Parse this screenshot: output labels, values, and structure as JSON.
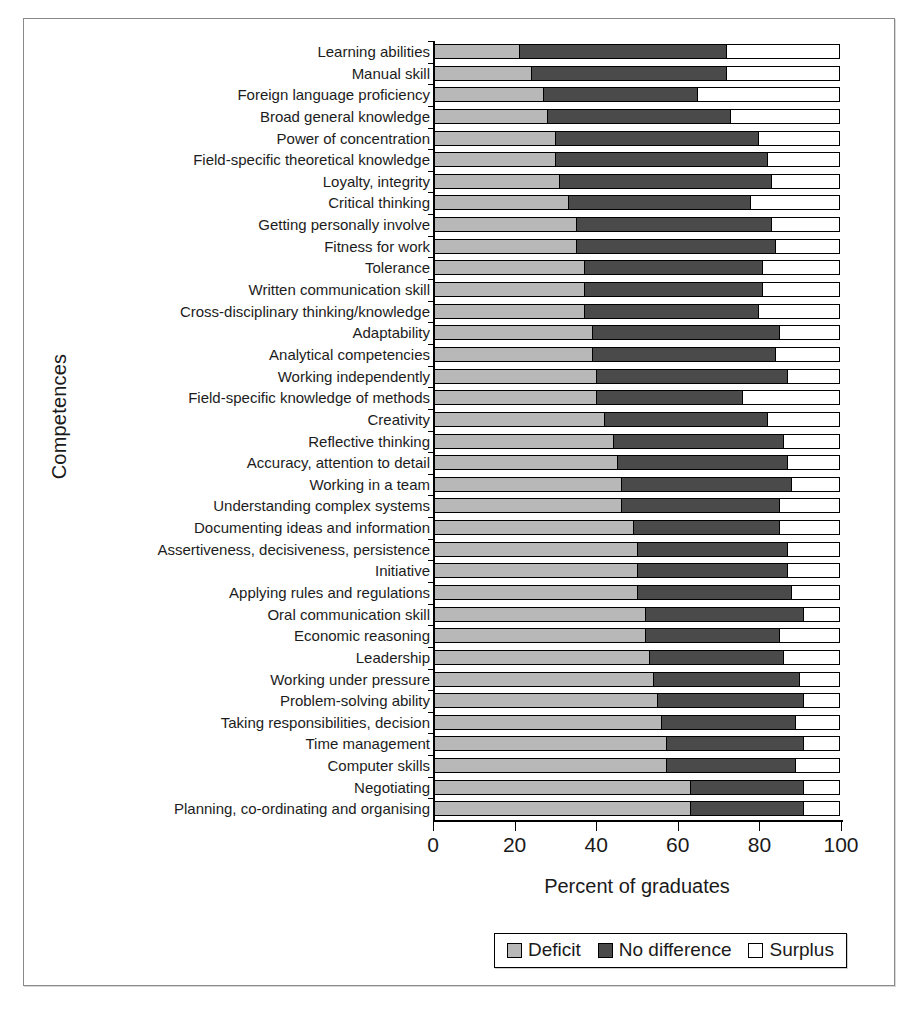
{
  "chart_data": {
    "type": "bar",
    "orientation": "horizontal",
    "stacked": true,
    "title": "",
    "xlabel": "Percent of graduates",
    "ylabel": "Competences",
    "xlim": [
      0,
      100
    ],
    "xticks": [
      "0",
      "20",
      "40",
      "60",
      "80",
      "100"
    ],
    "grid": false,
    "legend_position": "bottom",
    "legend": [
      "Deficit",
      "No difference",
      "Surplus"
    ],
    "colors": {
      "deficit": "#b8b8b8",
      "no_difference": "#4a4a4a",
      "surplus": "#ffffff",
      "outline": "#000000"
    },
    "categories": [
      "Learning abilities",
      "Manual skill",
      "Foreign language proficiency",
      "Broad general knowledge",
      "Power of concentration",
      "Field-specific theoretical knowledge",
      "Loyalty, integrity",
      "Critical thinking",
      "Getting personally involve",
      "Fitness for work",
      "Tolerance",
      "Written communication skill",
      "Cross-disciplinary thinking/knowledge",
      "Adaptability",
      "Analytical competencies",
      "Working independently",
      "Field-specific knowledge of methods",
      "Creativity",
      "Reflective thinking",
      "Accuracy, attention to detail",
      "Working in a team",
      "Understanding complex systems",
      "Documenting ideas and information",
      "Assertiveness, decisiveness, persistence",
      "Initiative",
      "Applying rules and regulations",
      "Oral communication skill",
      "Economic reasoning",
      "Leadership",
      "Working under pressure",
      "Problem-solving ability",
      "Taking responsibilities, decision",
      "Time management",
      "Computer skills",
      "Negotiating",
      "Planning, co-ordinating and organising"
    ],
    "series": [
      {
        "name": "Deficit",
        "values": [
          21,
          24,
          27,
          28,
          30,
          30,
          31,
          33,
          35,
          35,
          37,
          37,
          37,
          39,
          39,
          40,
          40,
          42,
          44,
          45,
          46,
          46,
          49,
          50,
          50,
          50,
          52,
          52,
          53,
          54,
          55,
          56,
          57,
          57,
          63,
          63
        ]
      },
      {
        "name": "No difference",
        "values": [
          51,
          48,
          38,
          45,
          50,
          52,
          52,
          45,
          48,
          49,
          44,
          44,
          43,
          46,
          45,
          47,
          36,
          40,
          42,
          42,
          42,
          39,
          36,
          37,
          37,
          38,
          39,
          33,
          33,
          36,
          36,
          33,
          34,
          32,
          28,
          28
        ]
      },
      {
        "name": "Surplus",
        "values": [
          28,
          28,
          35,
          27,
          20,
          18,
          17,
          22,
          17,
          16,
          19,
          19,
          20,
          15,
          16,
          13,
          24,
          18,
          14,
          13,
          12,
          15,
          15,
          13,
          13,
          12,
          9,
          15,
          14,
          10,
          9,
          11,
          9,
          11,
          9,
          9
        ]
      }
    ]
  }
}
